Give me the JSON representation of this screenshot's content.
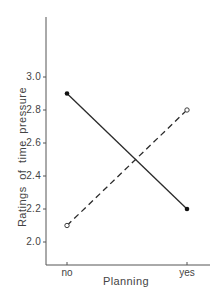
{
  "chart_data": {
    "type": "line",
    "title": "",
    "xlabel": "Planning",
    "ylabel": "Ratings of time pressure",
    "categories": [
      "no",
      "yes"
    ],
    "series": [
      {
        "name": "solid (filled markers)",
        "style": "solid",
        "marker": "filled-circle",
        "values": [
          2.9,
          2.2
        ]
      },
      {
        "name": "dashed (open markers)",
        "style": "dashed",
        "marker": "open-circle",
        "values": [
          2.1,
          2.8
        ]
      }
    ],
    "yticks": [
      "2.0",
      "2.2",
      "2.4",
      "2.6",
      "2.8",
      "3.0"
    ],
    "ylim": [
      1.86,
      3.46
    ],
    "grid": false,
    "legend": "none",
    "colors": {
      "line": "#2a2a2a",
      "axis": "#555555",
      "background": "#ffffff"
    }
  }
}
